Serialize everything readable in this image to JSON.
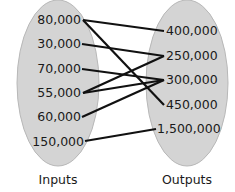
{
  "diagram": {
    "type": "mapping",
    "inputs_label": "Inputs",
    "outputs_label": "Outputs",
    "inputs": [
      "80,000",
      "30,000",
      "70,000",
      "55,000",
      "60,000",
      "150,000"
    ],
    "outputs": [
      "400,000",
      "250,000",
      "300,000",
      "450,000",
      "1,500,000"
    ],
    "mappings": [
      {
        "from": "80,000",
        "to": "400,000"
      },
      {
        "from": "80,000",
        "to": "450,000"
      },
      {
        "from": "30,000",
        "to": "250,000"
      },
      {
        "from": "70,000",
        "to": "300,000"
      },
      {
        "from": "55,000",
        "to": "250,000"
      },
      {
        "from": "55,000",
        "to": "300,000"
      },
      {
        "from": "60,000",
        "to": "300,000"
      },
      {
        "from": "150,000",
        "to": "1,500,000"
      }
    ],
    "colors": {
      "oval_fill": "#d4d4d4",
      "oval_stroke": "#b5b5b5",
      "line": "#111111"
    }
  }
}
